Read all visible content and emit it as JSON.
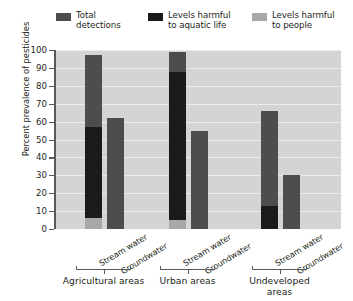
{
  "chart_data": {
    "type": "bar",
    "subtype": "stacked-bar-grouped",
    "title": "",
    "xlabel": "",
    "ylabel": "Percent prevalence of pesticides",
    "ylim": [
      0,
      100
    ],
    "ytick_step": 10,
    "yticks": [
      100,
      90,
      80,
      70,
      60,
      50,
      40,
      30,
      20,
      10,
      0
    ],
    "grid": true,
    "grid_axis": "y",
    "legend_position": "top",
    "legend": [
      {
        "label": "Total\ndetections",
        "color": "#4d4d4d",
        "key": "total_detections"
      },
      {
        "label": "Levels harmful\nto aquatic life",
        "color": "#1a1a1a",
        "key": "harmful_aquatic"
      },
      {
        "label": "Levels harmful\nto people",
        "color": "#a8a8a8",
        "key": "harmful_people"
      }
    ],
    "series": [
      {
        "name": "Total detections",
        "color": "#4d4d4d",
        "values": [
          97,
          62,
          99,
          55,
          66,
          30
        ]
      },
      {
        "name": "Levels harmful to aquatic life",
        "color": "#1a1a1a",
        "values": [
          57,
          0,
          88,
          0,
          13,
          0
        ]
      },
      {
        "name": "Levels harmful to people",
        "color": "#a8a8a8",
        "values": [
          6,
          0,
          5,
          0,
          0,
          0
        ]
      }
    ],
    "categories": [
      "Stream water",
      "Groundwater",
      "Stream water",
      "Groundwater",
      "Stream water",
      "Groundwater"
    ],
    "groups": [
      {
        "label": "Agricultural areas",
        "categories": [
          "Stream water",
          "Groundwater"
        ]
      },
      {
        "label": "Urban areas",
        "categories": [
          "Stream water",
          "Groundwater"
        ]
      },
      {
        "label": "Undeveloped\nareas",
        "categories": [
          "Stream water",
          "Groundwater"
        ]
      }
    ],
    "bars": [
      {
        "group": "Agricultural areas",
        "category": "Stream water",
        "total_detections": 97,
        "harmful_aquatic": 57,
        "harmful_people": 6
      },
      {
        "group": "Agricultural areas",
        "category": "Groundwater",
        "total_detections": 62,
        "harmful_aquatic": 0,
        "harmful_people": 0
      },
      {
        "group": "Urban areas",
        "category": "Stream water",
        "total_detections": 99,
        "harmful_aquatic": 88,
        "harmful_people": 5
      },
      {
        "group": "Urban areas",
        "category": "Groundwater",
        "total_detections": 55,
        "harmful_aquatic": 0,
        "harmful_people": 0
      },
      {
        "group": "Undeveloped areas",
        "category": "Stream water",
        "total_detections": 66,
        "harmful_aquatic": 13,
        "harmful_people": 0
      },
      {
        "group": "Undeveloped areas",
        "category": "Groundwater",
        "total_detections": 30,
        "harmful_aquatic": 0,
        "harmful_people": 0
      }
    ],
    "colors": {
      "plot_background": "#d4d4d4",
      "gridline": "#ececec",
      "axis": "#59595b",
      "text": "#231f20",
      "page_background": "#ffffff"
    }
  }
}
